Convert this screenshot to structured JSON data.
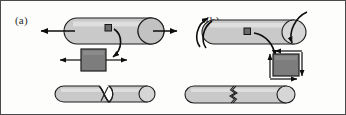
{
  "figure": {
    "width": 346,
    "height": 115,
    "background_color": "#fdfdfc",
    "border_color": "#4a4a4a",
    "line_color": "#0d0d0d",
    "cylinder_fill": "#c9c9c9",
    "cylinder_highlight": "#dedede",
    "element_fill": "#7d7d7d",
    "marker_fill": "#6a6a6a"
  },
  "panels": [
    {
      "id": "a",
      "label": "(a)",
      "loading": "tension",
      "specimen_top": {
        "name": "tensile-specimen",
        "orientation": "horizontal",
        "end_cap": "right"
      },
      "load_arrows": [
        {
          "name": "tension-arrow-left",
          "direction": "left"
        },
        {
          "name": "tension-arrow-right",
          "direction": "right"
        }
      ],
      "surface_marker": {
        "name": "stress-element-marker",
        "shape": "square"
      },
      "callout": {
        "name": "callout-arrow",
        "direction": "down-left"
      },
      "stress_element": {
        "name": "tension-stress-element",
        "shape": "square",
        "arrows": [
          {
            "name": "normal-stress-arrow-left",
            "direction": "left",
            "side": "left"
          },
          {
            "name": "normal-stress-arrow-right",
            "direction": "right",
            "side": "right"
          }
        ]
      },
      "specimen_fractured": {
        "name": "fractured-tensile-specimen",
        "failure_mode": "necking-cup-and-cone",
        "end_cap": "right"
      }
    },
    {
      "id": "b",
      "label": "(b)",
      "loading": "torsion",
      "specimen_top": {
        "name": "torsion-specimen",
        "orientation": "horizontal",
        "end_cap": "right"
      },
      "load_arrows": [
        {
          "name": "torque-arrow-left",
          "direction": "counterclockwise-wrap"
        },
        {
          "name": "torque-arrow-right",
          "direction": "clockwise-wrap"
        }
      ],
      "surface_marker": {
        "name": "stress-element-marker",
        "shape": "square"
      },
      "callout": {
        "name": "callout-arrow",
        "direction": "down-left"
      },
      "stress_element": {
        "name": "shear-stress-element",
        "shape": "square",
        "arrows": [
          {
            "name": "shear-arrow-top",
            "direction": "left",
            "side": "top"
          },
          {
            "name": "shear-arrow-right",
            "direction": "down",
            "side": "right"
          },
          {
            "name": "shear-arrow-bottom",
            "direction": "right",
            "side": "bottom"
          },
          {
            "name": "shear-arrow-left",
            "direction": "up",
            "side": "left"
          }
        ]
      },
      "specimen_fractured": {
        "name": "fractured-torsion-specimen",
        "failure_mode": "jagged-transverse-crack",
        "end_cap": "right"
      }
    }
  ]
}
